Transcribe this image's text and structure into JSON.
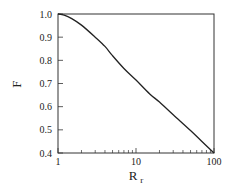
{
  "chart_data": {
    "type": "line",
    "title": "",
    "xlabel": "R",
    "xlabel_subscript": "r",
    "ylabel": "F",
    "xscale": "log",
    "xlim": [
      1,
      100
    ],
    "ylim": [
      0.4,
      1.0
    ],
    "grid": false,
    "legend": null,
    "xticks": [
      {
        "value": 1,
        "label": "1"
      },
      {
        "value": 10,
        "label": "10"
      },
      {
        "value": 100,
        "label": "100"
      }
    ],
    "x_minor_ticks": [
      2,
      3,
      4,
      5,
      6,
      7,
      8,
      9,
      20,
      30,
      40,
      50,
      60,
      70,
      80,
      90
    ],
    "yticks": [
      {
        "value": 1.0,
        "label": "1.0"
      },
      {
        "value": 0.9,
        "label": "0.9"
      },
      {
        "value": 0.8,
        "label": "0.8"
      },
      {
        "value": 0.7,
        "label": "0.7"
      },
      {
        "value": 0.6,
        "label": "0.6"
      },
      {
        "value": 0.5,
        "label": "0.5"
      },
      {
        "value": 0.4,
        "label": "0.4"
      }
    ],
    "series": [
      {
        "name": "F",
        "color": "#222222",
        "x": [
          1,
          1.2,
          1.5,
          2,
          3,
          4,
          5,
          7,
          10,
          15,
          20,
          30,
          50,
          70,
          100
        ],
        "y": [
          1.0,
          0.995,
          0.98,
          0.952,
          0.9,
          0.86,
          0.82,
          0.765,
          0.715,
          0.655,
          0.62,
          0.565,
          0.497,
          0.45,
          0.4
        ]
      }
    ]
  }
}
